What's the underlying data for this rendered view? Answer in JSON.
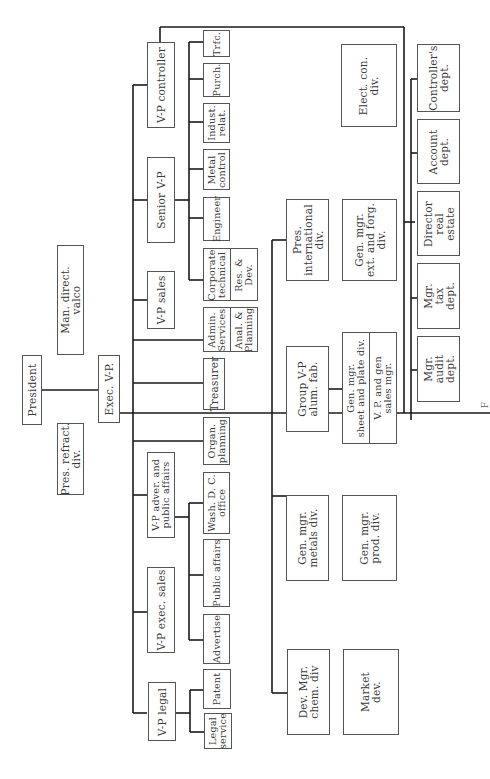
{
  "document": {
    "type": "organization chart (rotated 90° counter-clockwise scan)",
    "caption_fragment": "F"
  },
  "nodes": {
    "president": "President",
    "pres_refract": "Pres. refract.\ndiv.",
    "man_direct_valco": "Man. direct.\nvalco",
    "exec_vp": "Exec. V-P.",
    "vp_controller": "V-P controller",
    "senior_vp": "Senior V-P",
    "vp_sales": "V-P sales",
    "treasurer": "Treasurer",
    "organ_planning": "Organ.\nplanning",
    "vp_adver": "V-P adver. and\npublic affairs",
    "vp_exec_sales": "V-P exec. sales",
    "vp_legal": "V-P legal",
    "trfc": "Trfc.",
    "purch": "Purch.",
    "indust_relat": "Indust.\nrelat.",
    "metal_control": "Metal\ncontrol",
    "engineer": "Engineer",
    "corporate_technical": "Corporate\ntechnical",
    "res_dev": "Res. &\nDev.",
    "admin_services": "Admin.\nServices",
    "anal_planning": "Anal. &\nPlanning",
    "wash_dc": "Wash. D. C.\noffice",
    "public_affairs": "Public affairs",
    "advertise": "Advertise",
    "patent": "Patent",
    "legal_service": "Legal\nservice",
    "pres_international": "Pres.\ninternational\ndiv.",
    "gen_mgr_ext": "Gen. mgr.\next. and forg.\ndiv.",
    "group_vp_alum": "Group V-P\nalum. fab.",
    "gen_mgr_sheet": "Gen. mgr.\nsheet and plate div.",
    "vp_gen_sales": "V. P. and gen\nsales mgr.",
    "gen_mgr_metals": "Gen. mgr.\nmetals div.",
    "gen_mgr_prod": "Gen. mgr.\nprod. div.",
    "dev_mgr_chem": "Dev. Mgr.\nchem. div",
    "market_dev": "Market\ndev.",
    "elect_con": "Elect. con.\ndiv.",
    "controllers_dept": "Controller's\ndept.",
    "account_dept": "Account\ndept.",
    "director_real_estate": "Director\nreal\nestate",
    "mgr_tax": "Mgr.\ntax\ndept.",
    "mgr_audit": "Mgr.\naudit\ndept."
  },
  "colors": {
    "line": "#1a1a1a",
    "box_border": "#555555",
    "text": "#3a3a3a",
    "background": "#ffffff"
  }
}
